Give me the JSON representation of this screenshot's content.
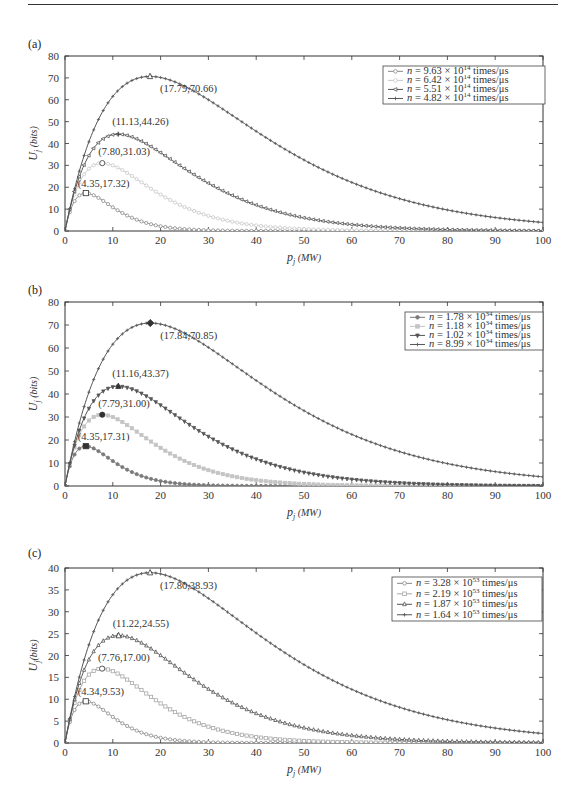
{
  "chart_data": [
    {
      "panel": "(a)",
      "type": "line",
      "xlabel": "p_j (MW)",
      "ylabel": "U_j (bits)",
      "xlim": [
        0,
        100
      ],
      "ylim": [
        0,
        80
      ],
      "xticks": [
        0,
        10,
        20,
        30,
        40,
        50,
        60,
        70,
        80,
        90,
        100
      ],
      "yticks": [
        0,
        10,
        20,
        30,
        40,
        50,
        60,
        70,
        80
      ],
      "grid": false,
      "legend_position": "upper right",
      "series": [
        {
          "name": "n = 9.63 × 10^14 times/μs",
          "legend_base": "n = 9.63 × 10",
          "legend_exp": "14",
          "legend_unit": " times/μs",
          "marker": "circle",
          "color": "#8a8a8a",
          "peak": {
            "x": 4.35,
            "y": 17.32
          },
          "peak_label": "(4.35,17.32)",
          "peak_marker": "square"
        },
        {
          "name": "n = 6.42 × 10^14 times/μs",
          "legend_base": "n = 6.42 × 10",
          "legend_exp": "14",
          "legend_unit": " times/μs",
          "marker": "circle",
          "color": "#c8c8c8",
          "peak": {
            "x": 7.8,
            "y": 31.03
          },
          "peak_label": "(7.80,31.03)",
          "peak_marker": "circle"
        },
        {
          "name": "n = 5.51 × 10^14 times/μs",
          "legend_base": "n = 5.51 × 10",
          "legend_exp": "14",
          "legend_unit": " times/μs",
          "marker": "triangle-left",
          "color": "#555555",
          "peak": {
            "x": 11.13,
            "y": 44.26
          },
          "peak_label": "(11.13,44.26)",
          "peak_marker": "plus"
        },
        {
          "name": "n = 4.82 × 10^14 times/μs",
          "legend_base": "n = 4.82 × 10",
          "legend_exp": "14",
          "legend_unit": " times/μs",
          "marker": "plus",
          "color": "#555555",
          "peak": {
            "x": 17.79,
            "y": 70.66
          },
          "peak_label": "(17.79,70.66)",
          "peak_marker": "triangle"
        }
      ]
    },
    {
      "panel": "(b)",
      "type": "line",
      "xlabel": "p_j (MW)",
      "ylabel": "U_j (bits)",
      "xlim": [
        0,
        100
      ],
      "ylim": [
        0,
        80
      ],
      "xticks": [
        0,
        10,
        20,
        30,
        40,
        50,
        60,
        70,
        80,
        90,
        100
      ],
      "yticks": [
        0,
        10,
        20,
        30,
        40,
        50,
        60,
        70,
        80
      ],
      "grid": false,
      "legend_position": "upper right",
      "series": [
        {
          "name": "n = 1.78 × 10^34 times/μs",
          "legend_base": "n = 1.78 × 10",
          "legend_exp": "34",
          "legend_unit": " times/μs",
          "marker": "circle-filled",
          "color": "#7a7a7a",
          "peak": {
            "x": 4.35,
            "y": 17.31
          },
          "peak_label": "(4.35,17.31)",
          "peak_marker": "square-filled"
        },
        {
          "name": "n = 1.18 × 10^34 times/μs",
          "legend_base": "n = 1.18 × 10",
          "legend_exp": "34",
          "legend_unit": " times/μs",
          "marker": "square-filled",
          "color": "#c4c4c4",
          "peak": {
            "x": 7.79,
            "y": 31.0
          },
          "peak_label": "(7.79,31.00)",
          "peak_marker": "circle-filled"
        },
        {
          "name": "n = 1.02 × 10^34 times/μs",
          "legend_base": "n = 1.02 × 10",
          "legend_exp": "34",
          "legend_unit": " times/μs",
          "marker": "triangle-down-filled",
          "color": "#555555",
          "peak": {
            "x": 11.16,
            "y": 43.37
          },
          "peak_label": "(11.16,43.37)",
          "peak_marker": "triangle-filled"
        },
        {
          "name": "n = 8.99 × 10^34 times/μs",
          "legend_base": "n = 8.99 × 10",
          "legend_exp": "34",
          "legend_unit": " times/μs",
          "marker": "plus",
          "color": "#555555",
          "peak": {
            "x": 17.84,
            "y": 70.85
          },
          "peak_label": "(17.84,70.85)",
          "peak_marker": "diamond-filled"
        }
      ]
    },
    {
      "panel": "(c)",
      "type": "line",
      "xlabel": "p_j (MW)",
      "ylabel": "U_j (bits)",
      "xlim": [
        0,
        100
      ],
      "ylim": [
        0,
        40
      ],
      "xticks": [
        0,
        10,
        20,
        30,
        40,
        50,
        60,
        70,
        80,
        90,
        100
      ],
      "yticks": [
        0,
        5,
        10,
        15,
        20,
        25,
        30,
        35,
        40
      ],
      "grid": false,
      "legend_position": "upper right",
      "series": [
        {
          "name": "n = 3.28 × 10^53 times/μs",
          "legend_base": "n = 3.28 × 10",
          "legend_exp": "53",
          "legend_unit": " times/μs",
          "marker": "circle",
          "color": "#8a8a8a",
          "peak": {
            "x": 4.34,
            "y": 9.53
          },
          "peak_label": "(4.34,9.53)",
          "peak_marker": "square"
        },
        {
          "name": "n = 2.19 × 10^53 times/μs",
          "legend_base": "n = 2.19 × 10",
          "legend_exp": "53",
          "legend_unit": " times/μs",
          "marker": "square",
          "color": "#a8a8a8",
          "peak": {
            "x": 7.76,
            "y": 17.0
          },
          "peak_label": "(7.76,17.00)",
          "peak_marker": "circle"
        },
        {
          "name": "n = 1.87 × 10^53 times/μs",
          "legend_base": "n = 1.87 × 10",
          "legend_exp": "53",
          "legend_unit": " times/μs",
          "marker": "triangle",
          "color": "#555555",
          "peak": {
            "x": 11.22,
            "y": 24.55
          },
          "peak_label": "(11.22,24.55)",
          "peak_marker": "triangle"
        },
        {
          "name": "n = 1.64 × 10^53 times/μs",
          "legend_base": "n = 1.64 × 10",
          "legend_exp": "53",
          "legend_unit": " times/μs",
          "marker": "plus",
          "color": "#555555",
          "peak": {
            "x": 17.8,
            "y": 38.93
          },
          "peak_label": "(17.80,38.93)",
          "peak_marker": "triangle"
        }
      ]
    }
  ],
  "panels": {
    "a": {
      "label": "(a)",
      "xlabel_main": "p",
      "xlabel_sub": "j",
      "xlabel_unit": " (MW)",
      "ylabel_main": "U",
      "ylabel_sub": "j",
      "ylabel_unit": " (bits)"
    },
    "b": {
      "label": "(b)",
      "xlabel_main": "p",
      "xlabel_sub": "j",
      "xlabel_unit": " (MW)",
      "ylabel_main": "U",
      "ylabel_sub": "j",
      "ylabel_unit": " (bits)"
    },
    "c": {
      "label": "(c)",
      "xlabel_main": "p",
      "xlabel_sub": "j",
      "xlabel_unit": " (MW)",
      "ylabel_main": "U",
      "ylabel_sub": "j",
      "ylabel_unit": "(bits)"
    }
  }
}
